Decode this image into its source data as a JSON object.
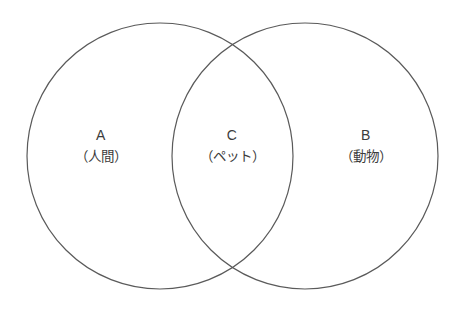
{
  "figure": {
    "type": "venn-diagram",
    "background_color": "#ffffff",
    "stroke_color": "#5a5a5a",
    "text_color": "#3c3c3c",
    "width": 462,
    "height": 323
  },
  "sets": [
    {
      "id": "A",
      "key": "A",
      "name": "（人間）",
      "cx": 160,
      "cy": 156,
      "r": 133
    },
    {
      "id": "B",
      "key": "B",
      "name": "（動物）",
      "cx": 305,
      "cy": 156,
      "r": 133
    }
  ],
  "intersection": {
    "id": "C",
    "key": "C",
    "name": "（ペット）"
  }
}
